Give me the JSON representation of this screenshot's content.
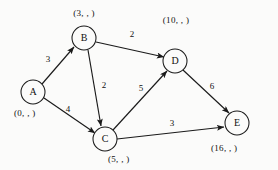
{
  "diagram": {
    "type": "directed-weighted-graph",
    "title": "",
    "background_color": "#fbfbfa",
    "stroke_color": "#1a1a1a",
    "nodes": [
      {
        "id": "A",
        "label": "A",
        "cx": 33,
        "cy": 92,
        "r": 12,
        "tuple": "(0,  ,  )",
        "tuple_x": 14,
        "tuple_y": 114,
        "tuple_anchor": "start"
      },
      {
        "id": "B",
        "label": "B",
        "cx": 84,
        "cy": 38,
        "r": 12,
        "tuple": "(3,  ,  )",
        "tuple_x": 84,
        "tuple_y": 14,
        "tuple_anchor": "middle"
      },
      {
        "id": "C",
        "label": "C",
        "cx": 105,
        "cy": 139,
        "r": 12,
        "tuple": "(5,  ,  )",
        "tuple_x": 108,
        "tuple_y": 160,
        "tuple_anchor": "start"
      },
      {
        "id": "D",
        "label": "D",
        "cx": 175,
        "cy": 61,
        "r": 12,
        "tuple": "(10,  ,  )",
        "tuple_x": 176,
        "tuple_y": 21,
        "tuple_anchor": "middle"
      },
      {
        "id": "E",
        "label": "E",
        "cx": 237,
        "cy": 123,
        "r": 12,
        "tuple": "(16,  ,  )",
        "tuple_x": 211,
        "tuple_y": 149,
        "tuple_anchor": "start"
      }
    ],
    "edges": [
      {
        "from": "A",
        "to": "B",
        "weight": "3",
        "wx": 48,
        "wy": 60
      },
      {
        "from": "A",
        "to": "C",
        "weight": "4",
        "wx": 68,
        "wy": 110
      },
      {
        "from": "B",
        "to": "C",
        "weight": "2",
        "wx": 104,
        "wy": 86
      },
      {
        "from": "B",
        "to": "D",
        "weight": "2",
        "wx": 132,
        "wy": 35
      },
      {
        "from": "C",
        "to": "D",
        "weight": "5",
        "wx": 141,
        "wy": 89
      },
      {
        "from": "C",
        "to": "E",
        "weight": "3",
        "wx": 172,
        "wy": 124
      },
      {
        "from": "D",
        "to": "E",
        "weight": "6",
        "wx": 212,
        "wy": 87
      }
    ]
  }
}
